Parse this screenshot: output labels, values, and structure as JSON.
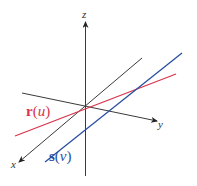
{
  "diagram": {
    "type": "3d-axes-with-skew-lines",
    "axes": {
      "z": {
        "label": "z"
      },
      "y": {
        "label": "y"
      },
      "x": {
        "label": "x"
      }
    },
    "lines": [
      {
        "name": "r",
        "param": "u",
        "func": "r",
        "lparen": "(",
        "rparen": ")",
        "color": "#d8344a"
      },
      {
        "name": "s",
        "param": "v",
        "func": "s",
        "lparen": "(",
        "rparen": ")",
        "color": "#2a4ea0"
      }
    ],
    "colors": {
      "axis": "#3a3a3a",
      "red_line": "#d8344a",
      "blue_line": "#2a4ea0"
    }
  }
}
